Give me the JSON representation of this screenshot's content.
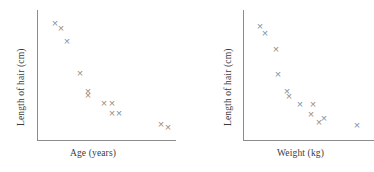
{
  "figure": {
    "width": 374,
    "height": 172,
    "background": "#ffffff",
    "marker_color": "#8f8f8f",
    "axis_color": "#8c8c8c",
    "text_color": "#3a3a3a",
    "marker_glyph": "x"
  },
  "chart_data": [
    {
      "type": "scatter",
      "title": "",
      "xlabel": "Age (years)",
      "ylabel": "Length of hair (cm)",
      "grid": false,
      "legend": null,
      "axis_ticks": false,
      "xlim": [
        0,
        100
      ],
      "ylim": [
        0,
        100
      ],
      "trend": "negative",
      "n_points": 12,
      "points": [
        {
          "x": 13.0,
          "y": 90.0
        },
        {
          "x": 16.5,
          "y": 86.0
        },
        {
          "x": 21.0,
          "y": 76.0
        },
        {
          "x": 31.0,
          "y": 51.0
        },
        {
          "x": 37.0,
          "y": 37.0
        },
        {
          "x": 37.0,
          "y": 34.0
        },
        {
          "x": 49.0,
          "y": 28.0
        },
        {
          "x": 54.0,
          "y": 28.0
        },
        {
          "x": 54.0,
          "y": 21.0
        },
        {
          "x": 59.0,
          "y": 21.0
        },
        {
          "x": 89.0,
          "y": 12.0
        },
        {
          "x": 94.0,
          "y": 10.0
        }
      ]
    },
    {
      "type": "scatter",
      "title": "",
      "xlabel": "Weight (kg)",
      "ylabel": "Length of hair (cm)",
      "grid": false,
      "legend": null,
      "axis_ticks": false,
      "xlim": [
        0,
        100
      ],
      "ylim": [
        0,
        100
      ],
      "trend": "negative",
      "n_points": 13,
      "points": [
        {
          "x": 13.0,
          "y": 88.0
        },
        {
          "x": 16.5,
          "y": 82.0
        },
        {
          "x": 25.0,
          "y": 70.0
        },
        {
          "x": 26.5,
          "y": 51.0
        },
        {
          "x": 33.5,
          "y": 37.0
        },
        {
          "x": 35.0,
          "y": 34.0
        },
        {
          "x": 44.0,
          "y": 28.0
        },
        {
          "x": 54.0,
          "y": 28.0
        },
        {
          "x": 52.0,
          "y": 20.0
        },
        {
          "x": 58.5,
          "y": 14.0
        },
        {
          "x": 62.5,
          "y": 17.0
        },
        {
          "x": 93.5,
          "y": 12.0
        },
        {
          "x": 44.0,
          "y": 28.0
        }
      ]
    }
  ],
  "panels": {
    "age": {
      "xlabel": "Age (years)",
      "ylabel": "Length of hair (cm)",
      "markers": [
        {
          "left": 55,
          "top": 23
        },
        {
          "left": 61,
          "top": 28
        },
        {
          "left": 67,
          "top": 41
        },
        {
          "left": 80,
          "top": 73
        },
        {
          "left": 88,
          "top": 91
        },
        {
          "left": 88,
          "top": 95
        },
        {
          "left": 104,
          "top": 103
        },
        {
          "left": 112,
          "top": 103
        },
        {
          "left": 112,
          "top": 113
        },
        {
          "left": 119,
          "top": 113
        },
        {
          "left": 161,
          "top": 124
        },
        {
          "left": 168,
          "top": 127
        }
      ]
    },
    "weight": {
      "xlabel": "Weight (kg)",
      "ylabel": "Length of hair (cm)",
      "markers": [
        {
          "left": 73,
          "top": 26
        },
        {
          "left": 78,
          "top": 33
        },
        {
          "left": 89,
          "top": 49
        },
        {
          "left": 91,
          "top": 74
        },
        {
          "left": 100,
          "top": 91
        },
        {
          "left": 102,
          "top": 96
        },
        {
          "left": 113,
          "top": 104
        },
        {
          "left": 126,
          "top": 104
        },
        {
          "left": 124,
          "top": 114
        },
        {
          "left": 132,
          "top": 122
        },
        {
          "left": 137,
          "top": 118
        },
        {
          "left": 170,
          "top": 125
        }
      ]
    }
  }
}
